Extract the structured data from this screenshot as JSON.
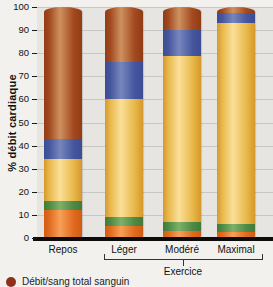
{
  "chart_data": {
    "type": "bar",
    "stacked": true,
    "title": "",
    "ylabel": "% débit cardiaque",
    "xlabel": "",
    "ylim": [
      0,
      100
    ],
    "yticks": [
      0,
      10,
      20,
      30,
      40,
      50,
      60,
      70,
      80,
      90,
      100
    ],
    "grid": "horizontal",
    "categories": [
      "Repos",
      "Léger",
      "Modéré",
      "Maximal"
    ],
    "group": {
      "label": "Exercice",
      "members": [
        "Léger",
        "Modéré",
        "Maximal"
      ]
    },
    "series": [
      {
        "name": "segment-orange",
        "color": "#e06a1e",
        "edge": "#d05c14",
        "highlight": "#f8a058",
        "values": [
          12,
          5,
          3,
          2.5
        ]
      },
      {
        "name": "segment-green",
        "color": "#4d8a44",
        "edge": "#427a3a",
        "highlight": "#7fb068",
        "values": [
          4,
          4,
          4,
          3.5
        ]
      },
      {
        "name": "segment-yellow",
        "color": "#e8b84b",
        "edge": "#d6982c",
        "highlight": "#fae098",
        "values": [
          18,
          51,
          72,
          87
        ]
      },
      {
        "name": "segment-blue",
        "color": "#46569e",
        "edge": "#3d4d94",
        "highlight": "#7786bd",
        "values": [
          9,
          16,
          11,
          4.5
        ]
      },
      {
        "name": "segment-brown",
        "color": "#a2491f",
        "edge": "#913c16",
        "highlight": "#ce9160",
        "values": [
          57,
          24,
          10,
          2.5
        ]
      }
    ]
  },
  "legend": {
    "items": [
      {
        "label": "Débit/sang total sanguin",
        "color": "#8f301b"
      }
    ]
  },
  "layout_note": ""
}
